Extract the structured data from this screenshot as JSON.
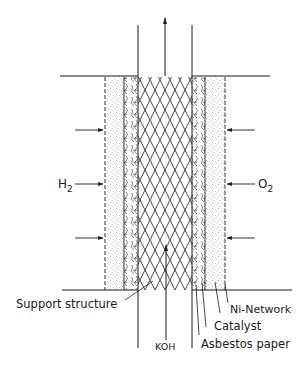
{
  "diagram": {
    "type": "fuel-cell cross-section",
    "labels": {
      "h2": "H",
      "h2_sub": "2",
      "o2": "O",
      "o2_sub": "2",
      "koh": "KOH",
      "support_structure": "Support structure",
      "ni_network": "Ni-Network",
      "catalyst": "Catalyst",
      "asbestos_paper": "Asbestos paper"
    },
    "colors": {
      "line": "#1a1a1a",
      "stipple": "#555555",
      "background": "#ffffff"
    },
    "arrows": {
      "gas_inlet_rows_y": [
        130,
        184,
        238
      ],
      "outlet_direction": "up",
      "koh_direction": "up"
    }
  }
}
